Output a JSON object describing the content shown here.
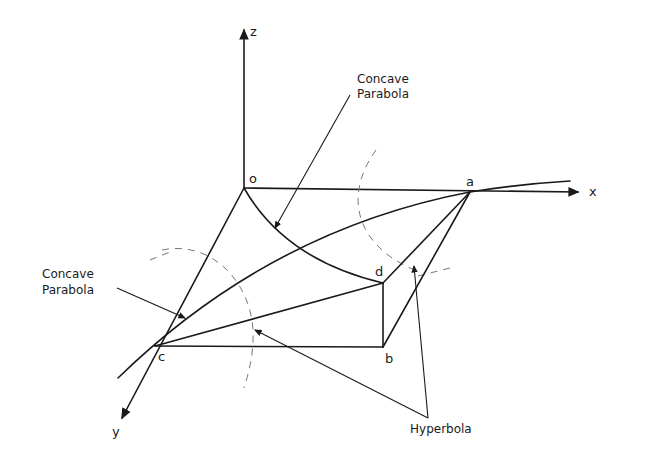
{
  "diagram": {
    "axes": {
      "z": "z",
      "x": "x",
      "y": "y"
    },
    "points": {
      "o": "o",
      "a": "a",
      "b": "b",
      "c": "c",
      "d": "d"
    },
    "annotations": {
      "concave_parabola_top": {
        "line1": "Concave",
        "line2": "Parabola"
      },
      "concave_parabola_left": {
        "line1": "Concave",
        "line2": "Parabola"
      },
      "hyperbola": "Hyperbola"
    }
  }
}
